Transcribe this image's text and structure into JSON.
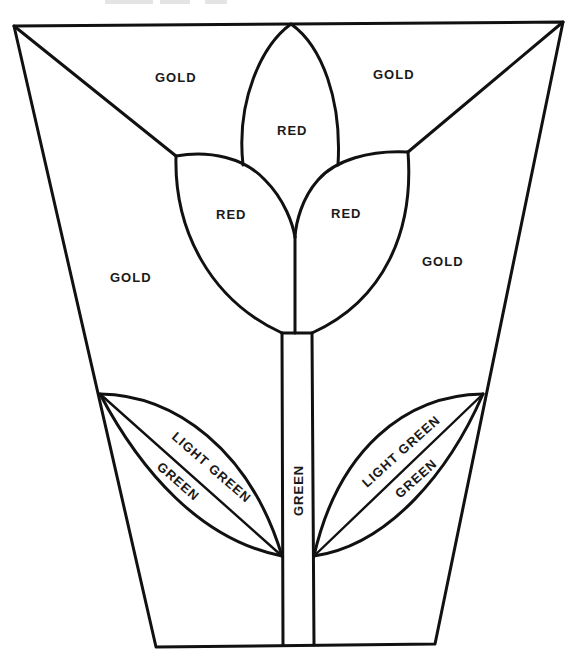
{
  "diagram": {
    "type": "quilt-block-pattern",
    "header_partial": "",
    "regions": [
      {
        "id": "gold-top-left",
        "label": "GOLD",
        "color_name": "gold"
      },
      {
        "id": "gold-top-right",
        "label": "GOLD",
        "color_name": "gold"
      },
      {
        "id": "gold-left",
        "label": "GOLD",
        "color_name": "gold"
      },
      {
        "id": "gold-right",
        "label": "GOLD",
        "color_name": "gold"
      },
      {
        "id": "petal-center",
        "label": "RED",
        "color_name": "red"
      },
      {
        "id": "petal-left",
        "label": "RED",
        "color_name": "red"
      },
      {
        "id": "petal-right",
        "label": "RED",
        "color_name": "red"
      },
      {
        "id": "stem",
        "label": "GREEN",
        "color_name": "green"
      },
      {
        "id": "leaf-left-upper",
        "label": "LIGHT GREEN",
        "color_name": "light green"
      },
      {
        "id": "leaf-left-lower",
        "label": "GREEN",
        "color_name": "green"
      },
      {
        "id": "leaf-right-upper",
        "label": "LIGHT GREEN",
        "color_name": "light green"
      },
      {
        "id": "leaf-right-lower",
        "label": "GREEN",
        "color_name": "green"
      }
    ]
  },
  "labels": {
    "gold_top_left": "GOLD",
    "gold_top_right": "GOLD",
    "gold_left": "GOLD",
    "gold_right": "GOLD",
    "red_center": "RED",
    "red_left": "RED",
    "red_right": "RED",
    "stem": "GREEN",
    "leaf_left_light": "LIGHT GREEN",
    "leaf_left_dark": "GREEN",
    "leaf_right_light": "LIGHT GREEN",
    "leaf_right_dark": "GREEN"
  },
  "colors": {
    "line": "#111111",
    "background": "#ffffff"
  }
}
